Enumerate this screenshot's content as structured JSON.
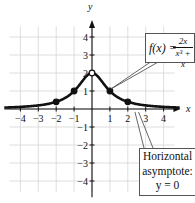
{
  "chart_data": {
    "type": "line",
    "title": "",
    "function": "f(x) = 2x / (x^3 + x)",
    "simplified": "2 / (x^2 + 1), x != 0",
    "xlabel": "x",
    "ylabel": "y",
    "xlim": [
      -4.5,
      4.5
    ],
    "ylim": [
      -4.5,
      4.5
    ],
    "x_ticks": [
      -4,
      -3,
      -2,
      -1,
      1,
      2,
      3,
      4
    ],
    "x_tick_labels": [
      "−4",
      "−3",
      "−2",
      "−1",
      "1",
      "2",
      "3",
      "4"
    ],
    "y_ticks": [
      -4,
      -3,
      -2,
      -1,
      1,
      2,
      3,
      4
    ],
    "y_tick_labels": [
      "−4",
      "−3",
      "−2",
      "−1",
      "1",
      "2",
      "3",
      "4"
    ],
    "grid": true,
    "points": [
      {
        "x": -2,
        "y": 0.4,
        "style": "filled"
      },
      {
        "x": -1,
        "y": 1,
        "style": "filled"
      },
      {
        "x": 0,
        "y": 2,
        "style": "open"
      },
      {
        "x": 1,
        "y": 1,
        "style": "filled"
      },
      {
        "x": 2,
        "y": 0.4,
        "style": "filled"
      }
    ],
    "asymptote": {
      "type": "horizontal",
      "y": 0
    },
    "annotations": [
      {
        "text": "f(x) = 2x / (x³ + x)",
        "points_to": [
          1,
          1
        ]
      },
      {
        "text": "Horizontal asymptote: y = 0",
        "points_to": [
          2.5,
          0
        ]
      }
    ]
  },
  "labels": {
    "x_axis": "x",
    "y_axis": "y",
    "formula_lhs": "f(x) =",
    "formula_num": "2x",
    "formula_den": "x³ + x",
    "asym_line1": "Horizontal",
    "asym_line2": "asymptote:",
    "asym_line3": "y = 0"
  },
  "colors": {
    "curve": "#111111",
    "grid": "#d4d4d4",
    "axis": "#111111",
    "background": "#ffffff"
  }
}
